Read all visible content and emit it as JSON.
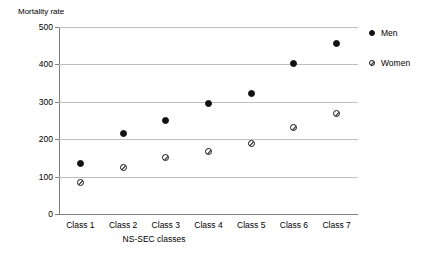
{
  "chart_data": {
    "type": "scatter",
    "title": "",
    "ylabel": "Mortality rate",
    "xlabel": "NS-SEC classes",
    "categories": [
      "Class 1",
      "Class 2",
      "Class 3",
      "Class 4",
      "Class 5",
      "Class 6",
      "Class 7"
    ],
    "ylim": [
      0,
      500
    ],
    "yticks": [
      0,
      100,
      200,
      300,
      400,
      500
    ],
    "ytick_labels": [
      "0",
      "100",
      "200",
      "300",
      "400",
      "500"
    ],
    "grid": true,
    "legend_position": "right",
    "series": [
      {
        "name": "Men",
        "marker": "filled-circle",
        "color": "#111111",
        "values": [
          135,
          215,
          251,
          295,
          321,
          403,
          456
        ]
      },
      {
        "name": "Women",
        "marker": "open-circle-slash",
        "color": "#111111",
        "values": [
          83,
          123,
          152,
          168,
          189,
          231,
          270
        ]
      }
    ]
  },
  "legend": {
    "items": [
      {
        "label": "Men",
        "marker": "men-marker-icon"
      },
      {
        "label": "Women",
        "marker": "women-marker-icon"
      }
    ]
  }
}
